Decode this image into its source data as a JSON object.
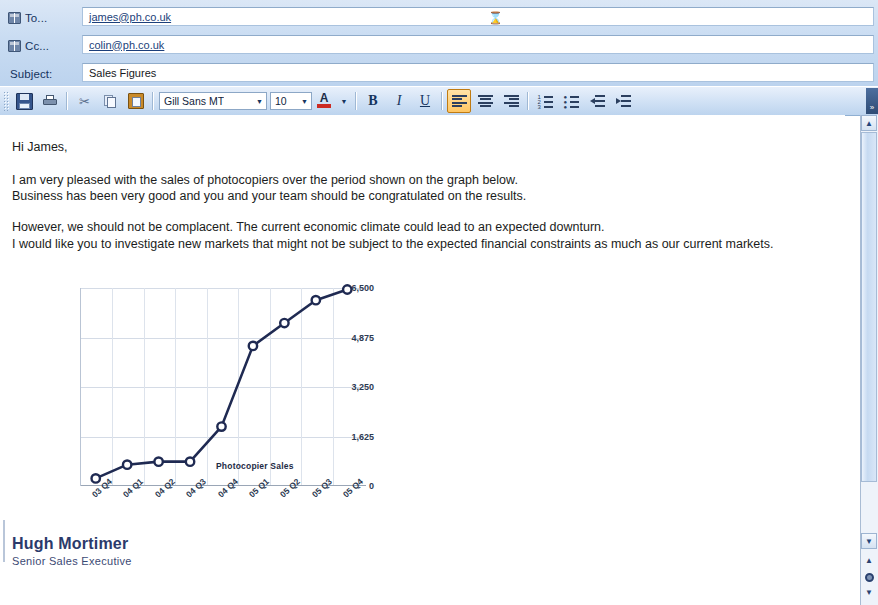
{
  "header": {
    "to_label": "To...",
    "to_value": "james@ph.co.uk",
    "cc_label": "Cc...",
    "cc_value": "colin@ph.co.uk",
    "subject_label": "Subject:",
    "subject_value": "Sales Figures"
  },
  "toolbar": {
    "save_label": "",
    "print_label": "",
    "cut_label": "",
    "copy_label": "",
    "paste_label": "",
    "font_name": "Gill Sans MT",
    "font_size": "10",
    "bold_label": "B",
    "italic_label": "I",
    "underline_label": "U",
    "font_color_label": "A",
    "dropdown_arrow": "▼",
    "overflow_label": "»"
  },
  "message": {
    "greeting": "Hi James,",
    "paragraph1_line1": "I am very pleased with the sales of photocopiers over the period shown on the graph below.",
    "paragraph1_line2": "Business has been very good and you and your team should be congratulated on the results.",
    "paragraph2_line1": "However, we should not be complacent. The current economic climate could lead to an expected downturn.",
    "paragraph2_line2": "I would like you to investigate new markets that might not be subject to the expected financial constraints as much as our current markets."
  },
  "signature": {
    "name": "Hugh Mortimer",
    "title": "Senior Sales Executive"
  },
  "scrollbar": {
    "up_arrow": "▲",
    "down_arrow": "▼",
    "prev_object": "≡",
    "next_object": "≡"
  },
  "chart_data": {
    "type": "line",
    "title": "",
    "legend": "Photocopier Sales",
    "legend_position": "inside-bottom-right",
    "xlabel": "",
    "ylabel": "",
    "grid": true,
    "ylim": [
      0,
      6500
    ],
    "yticks": [
      0,
      1625,
      3250,
      4875,
      6500
    ],
    "ytick_labels": [
      "0",
      "1,625",
      "3,250",
      "4,875",
      "6,500"
    ],
    "categories": [
      "03 Q4",
      "04 Q1",
      "04 Q2",
      "04 Q3",
      "04 Q4",
      "05 Q1",
      "05 Q2",
      "05 Q3",
      "05 Q4"
    ],
    "series": [
      {
        "name": "Photocopier Sales",
        "values": [
          250,
          700,
          800,
          800,
          1950,
          4600,
          5350,
          6100,
          6450
        ],
        "color": "#1f2a52",
        "marker": "circle"
      }
    ]
  }
}
